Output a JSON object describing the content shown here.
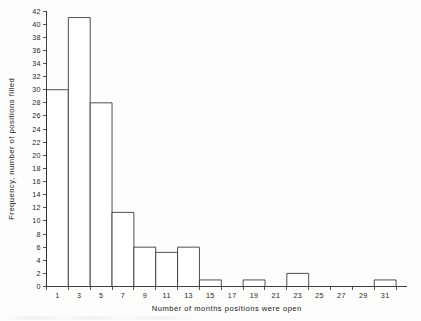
{
  "chart_data": {
    "type": "bar",
    "title": "",
    "subtitle": "",
    "xlabel": "Number of months positions were open",
    "ylabel": "Frequency, number of positions filled",
    "xlim": [
      0,
      33
    ],
    "ylim": [
      0,
      42
    ],
    "grid": false,
    "legend": false,
    "bin_width": 2,
    "x_tick_values": [
      0,
      2,
      4,
      6,
      8,
      10,
      12,
      14,
      16,
      18,
      20,
      22,
      24,
      26,
      28,
      30,
      32
    ],
    "x_tick_labels": [
      "1",
      "3",
      "5",
      "7",
      "9",
      "11",
      "13",
      "15",
      "17",
      "19",
      "21",
      "23",
      "25",
      "27",
      "29",
      "31"
    ],
    "x_label_positions": [
      1,
      3,
      5,
      7,
      9,
      11,
      13,
      15,
      17,
      19,
      21,
      23,
      25,
      27,
      29,
      31
    ],
    "y_tick_labels": [
      "0",
      "2",
      "4",
      "6",
      "8",
      "10",
      "12",
      "14",
      "16",
      "18",
      "20",
      "22",
      "24",
      "26",
      "28",
      "30",
      "32",
      "34",
      "36",
      "38",
      "40",
      "42"
    ],
    "y_tick_values": [
      0,
      2,
      4,
      6,
      8,
      10,
      12,
      14,
      16,
      18,
      20,
      22,
      24,
      26,
      28,
      30,
      32,
      34,
      36,
      38,
      40,
      42
    ],
    "bins": [
      {
        "bin_start": 0,
        "bin_end": 2,
        "center": 1,
        "label": "1",
        "value": 30
      },
      {
        "bin_start": 2,
        "bin_end": 4,
        "center": 3,
        "label": "3",
        "value": 41
      },
      {
        "bin_start": 4,
        "bin_end": 6,
        "center": 5,
        "label": "5",
        "value": 28
      },
      {
        "bin_start": 6,
        "bin_end": 8,
        "center": 7,
        "label": "7",
        "value": 11.3
      },
      {
        "bin_start": 8,
        "bin_end": 10,
        "center": 9,
        "label": "9",
        "value": 6
      },
      {
        "bin_start": 10,
        "bin_end": 12,
        "center": 11,
        "label": "11",
        "value": 5.2
      },
      {
        "bin_start": 12,
        "bin_end": 14,
        "center": 13,
        "label": "13",
        "value": 6
      },
      {
        "bin_start": 14,
        "bin_end": 16,
        "center": 15,
        "label": "15",
        "value": 1
      },
      {
        "bin_start": 16,
        "bin_end": 18,
        "center": 17,
        "label": "17",
        "value": 0
      },
      {
        "bin_start": 18,
        "bin_end": 20,
        "center": 19,
        "label": "19",
        "value": 1
      },
      {
        "bin_start": 20,
        "bin_end": 22,
        "center": 21,
        "label": "21",
        "value": 0
      },
      {
        "bin_start": 22,
        "bin_end": 24,
        "center": 23,
        "label": "23",
        "value": 2
      },
      {
        "bin_start": 24,
        "bin_end": 26,
        "center": 25,
        "label": "25",
        "value": 0
      },
      {
        "bin_start": 26,
        "bin_end": 28,
        "center": 27,
        "label": "27",
        "value": 0
      },
      {
        "bin_start": 28,
        "bin_end": 30,
        "center": 29,
        "label": "29",
        "value": 0
      },
      {
        "bin_start": 30,
        "bin_end": 32,
        "center": 31,
        "label": "31",
        "value": 1
      }
    ],
    "categories": [
      "1",
      "3",
      "5",
      "7",
      "9",
      "11",
      "13",
      "15",
      "17",
      "19",
      "21",
      "23",
      "25",
      "27",
      "29",
      "31"
    ],
    "values": [
      30,
      41,
      28,
      11.3,
      6,
      5.2,
      6,
      1,
      0,
      1,
      0,
      2,
      0,
      0,
      0,
      1
    ],
    "colors": {
      "bar_fill": "#ffffff",
      "bar_stroke": "#303030",
      "axis": "#2b2b2b",
      "text": "#202020",
      "background": "#fdfdfc"
    }
  }
}
